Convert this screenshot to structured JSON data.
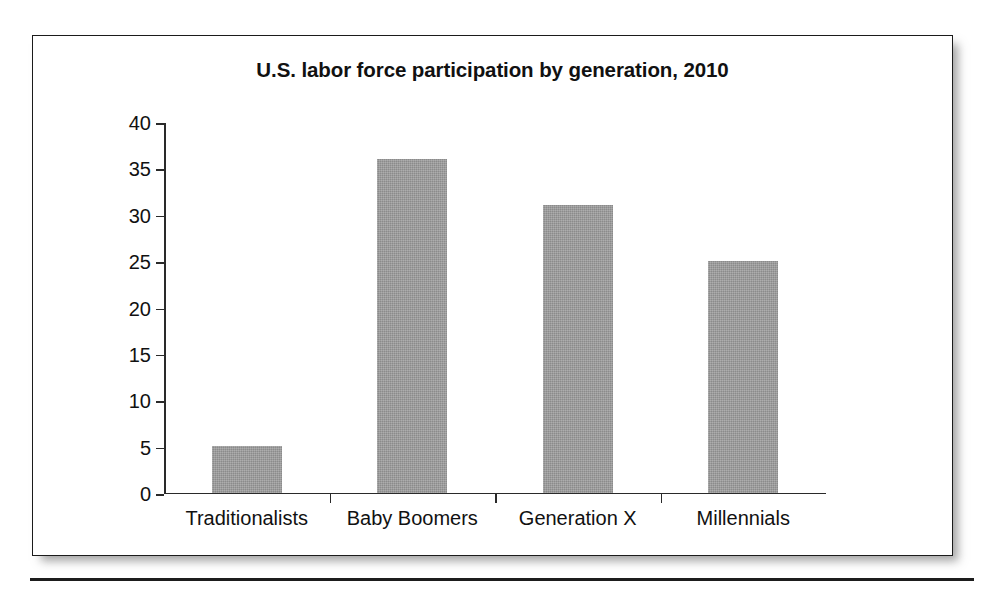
{
  "figure": {
    "title": "U.S. labor force participation by generation, 2010"
  },
  "chart_data": {
    "type": "bar",
    "title": "U.S. labor force participation by generation, 2010",
    "xlabel": "",
    "ylabel": "",
    "categories": [
      "Traditionalists",
      "Baby Boomers",
      "Generation X",
      "Millennials"
    ],
    "values": [
      5,
      36,
      31,
      25
    ],
    "ylim": [
      0,
      40
    ],
    "ytick_labels": [
      "0",
      "5",
      "10",
      "15",
      "20",
      "25",
      "30",
      "35",
      "40"
    ],
    "ytick_values": [
      0,
      5,
      10,
      15,
      20,
      25,
      30,
      35,
      40
    ],
    "grid": false,
    "legend": null,
    "bar_color": "#9a9a9a",
    "axis_color": "#2a2a2a",
    "background_color": "#ffffff"
  }
}
